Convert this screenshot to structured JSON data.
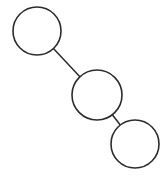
{
  "diagram": {
    "type": "tree",
    "background": "#ffffff",
    "stroke_color": "#2b2b2b",
    "nodes": [
      {
        "id": "n1",
        "label": "",
        "cx": 37,
        "cy": 31,
        "r": 24
      },
      {
        "id": "n2",
        "label": "",
        "cx": 97,
        "cy": 95,
        "r": 25
      },
      {
        "id": "n3",
        "label": "",
        "cx": 135,
        "cy": 144,
        "r": 24
      }
    ],
    "edges": [
      {
        "from": "n1",
        "to": "n2"
      },
      {
        "from": "n2",
        "to": "n3"
      }
    ]
  }
}
